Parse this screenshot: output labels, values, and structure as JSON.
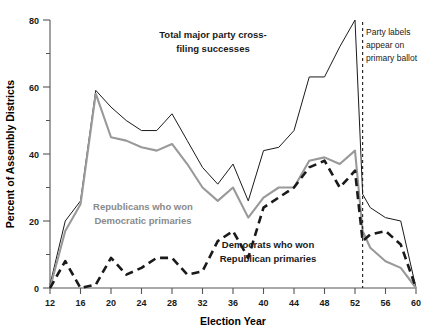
{
  "chart_data": {
    "type": "line",
    "title": "",
    "xlabel": "Election Year",
    "ylabel": "Percent of Assembly Districts",
    "xlim": [
      12,
      60
    ],
    "ylim": [
      0,
      80
    ],
    "xticks": [
      12,
      16,
      20,
      24,
      28,
      32,
      36,
      40,
      44,
      48,
      52,
      56,
      60
    ],
    "xtick_labels": [
      "12",
      "16",
      "20",
      "24",
      "28",
      "32",
      "36",
      "40",
      "44",
      "48",
      "52",
      "56",
      "60"
    ],
    "yticks": [
      0,
      20,
      40,
      60,
      80
    ],
    "ytick_labels": [
      "0",
      "20",
      "40",
      "60",
      "80"
    ],
    "yminorticks": [
      10,
      30,
      50,
      70
    ],
    "grid": false,
    "legend_position": "inline-annotations",
    "x": [
      12,
      14,
      16,
      18,
      20,
      22,
      24,
      26,
      28,
      30,
      32,
      34,
      36,
      38,
      40,
      42,
      44,
      46,
      48,
      50,
      52,
      54,
      56,
      58,
      60
    ],
    "series": [
      {
        "name": "Total major party cross-filing successes",
        "color": "#1a1a1a",
        "style": "solid",
        "values": [
          1,
          20,
          26,
          59,
          54,
          50,
          47,
          47,
          52,
          44,
          36,
          31,
          37,
          26,
          41,
          42,
          47,
          63,
          63,
          72,
          80,
          73,
          72,
          75,
          79
        ]
      },
      {
        "name": "Republicans who won Democratic primaries",
        "color": "#999999",
        "style": "solid",
        "values": [
          0,
          17,
          25,
          58,
          45,
          44,
          42,
          41,
          43,
          37,
          30,
          26,
          30,
          21,
          27,
          30,
          30,
          38,
          39,
          37,
          41,
          34,
          41,
          53,
          55
        ]
      },
      {
        "name": "Democrats who won Republican primaries",
        "color": "#1a1a1a",
        "style": "dashed",
        "values": [
          0,
          8,
          0,
          1,
          9,
          4,
          6,
          9,
          9,
          4,
          5,
          14,
          17,
          9,
          24,
          27,
          30,
          36,
          38,
          30,
          35,
          27,
          36,
          31,
          24
        ]
      }
    ],
    "post_marker_x": [
      53,
      54,
      56,
      58,
      60
    ],
    "series_tail": [
      {
        "name": "Total major party cross-filing successes",
        "values": [
          28,
          24,
          21,
          20,
          0
        ]
      },
      {
        "name": "Republicans who won Democratic primaries",
        "values": [
          17,
          12,
          8,
          6,
          0
        ]
      },
      {
        "name": "Democrats who won Republican primaries",
        "values": [
          14,
          16,
          17,
          13,
          0
        ]
      }
    ],
    "annotations": [
      {
        "id": "total-label",
        "lines": [
          "Total major party cross-",
          "filing successes"
        ],
        "color": "#1a1a1a"
      },
      {
        "id": "republicans-label",
        "lines": [
          "Republicans who won",
          "Democratic primaries"
        ],
        "color": "#8a8a8a"
      },
      {
        "id": "democrats-label",
        "lines": [
          "Democrats who won",
          "Republican primaries"
        ],
        "color": "#1a1a1a"
      },
      {
        "id": "party-labels-note",
        "lines": [
          "Party labels",
          "appear on",
          "primary ballot"
        ],
        "color": "#1a1a1a",
        "marker_x": 53,
        "marker_style": "dashed-vertical"
      }
    ]
  },
  "axes": {
    "xlabel": "Election Year",
    "ylabel": "Percent of Assembly Districts"
  },
  "annotations": {
    "total": {
      "line1": "Total major party cross-",
      "line2": "filing successes"
    },
    "republicans": {
      "line1": "Republicans who won",
      "line2": "Democratic primaries"
    },
    "democrats": {
      "line1": "Democrats who won",
      "line2": "Republican primaries"
    },
    "party_labels": {
      "line1": "Party labels",
      "line2": "appear on",
      "line3": "primary ballot"
    }
  },
  "colors": {
    "total_line": "#1a1a1a",
    "republican_line": "#999999",
    "democrat_line": "#1a1a1a",
    "axis": "#555555"
  }
}
